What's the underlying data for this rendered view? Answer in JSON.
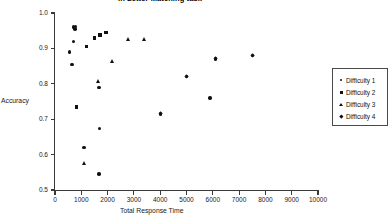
{
  "chart_data": {
    "type": "scatter",
    "title": "in Letter Matching task",
    "xlabel": "Total Response Time",
    "ylabel": "Accuracy",
    "xlim": [
      0,
      10000
    ],
    "ylim": [
      0.5,
      1.0
    ],
    "xticks": [
      0,
      1000,
      2000,
      3000,
      4000,
      5000,
      6000,
      7000,
      8000,
      9000,
      10000
    ],
    "xtick_labels": [
      "0",
      "1000",
      "2000",
      "3000",
      "4000",
      "5000",
      "6000",
      "7000",
      "8000",
      "9000",
      "10000"
    ],
    "yticks": [
      0.5,
      0.6,
      0.7,
      0.8,
      0.9,
      1.0
    ],
    "ytick_labels": [
      "0.5",
      "0.6",
      "0.7",
      "0.8",
      "0.9",
      "1.0"
    ],
    "grid": false,
    "legend_position": "right",
    "series": [
      {
        "name": "Difficulty 1",
        "marker": "circle",
        "points": [
          {
            "x": 560,
            "y": 0.89
          },
          {
            "x": 700,
            "y": 0.96
          },
          {
            "x": 760,
            "y": 0.955
          },
          {
            "x": 790,
            "y": 0.962
          },
          {
            "x": 700,
            "y": 0.92
          },
          {
            "x": 640,
            "y": 0.855
          },
          {
            "x": 1680,
            "y": 0.79
          },
          {
            "x": 1100,
            "y": 0.62
          },
          {
            "x": 1680,
            "y": 0.545
          },
          {
            "x": 4000,
            "y": 0.715
          },
          {
            "x": 1700,
            "y": 0.673
          },
          {
            "x": 5000,
            "y": 0.82
          },
          {
            "x": 6100,
            "y": 0.87
          },
          {
            "x": 7500,
            "y": 0.88
          },
          {
            "x": 5900,
            "y": 0.76
          }
        ]
      },
      {
        "name": "Difficulty 2",
        "marker": "square",
        "points": [
          {
            "x": 1200,
            "y": 0.905
          },
          {
            "x": 1500,
            "y": 0.93
          },
          {
            "x": 1700,
            "y": 0.938
          },
          {
            "x": 1950,
            "y": 0.945
          },
          {
            "x": 820,
            "y": 0.735
          }
        ]
      },
      {
        "name": "Difficulty 3",
        "marker": "triangle",
        "points": [
          {
            "x": 2200,
            "y": 0.862
          },
          {
            "x": 2800,
            "y": 0.925
          },
          {
            "x": 3400,
            "y": 0.925
          },
          {
            "x": 1650,
            "y": 0.806
          },
          {
            "x": 1120,
            "y": 0.575
          }
        ]
      },
      {
        "name": "Difficulty 4",
        "marker": "diamond",
        "points": [
          {
            "x": 4000,
            "y": 0.715
          },
          {
            "x": 5000,
            "y": 0.82
          },
          {
            "x": 6100,
            "y": 0.87
          },
          {
            "x": 7500,
            "y": 0.88
          }
        ]
      }
    ]
  },
  "legend": {
    "entries": [
      {
        "label": "Difficulty 1",
        "marker": "circle"
      },
      {
        "label": "Difficulty 2",
        "marker": "square"
      },
      {
        "label": "Difficulty 3",
        "marker": "triangle"
      },
      {
        "label": "Difficulty 4",
        "marker": "diamond"
      }
    ]
  }
}
